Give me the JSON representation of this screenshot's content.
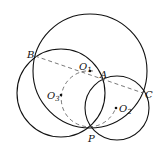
{
  "diagram": {
    "type": "geometry-circles",
    "stroke_color": "#111111",
    "background": "#ffffff",
    "points": [
      {
        "id": "B",
        "label": "B",
        "x": 35,
        "y": 56
      },
      {
        "id": "A",
        "label": "A",
        "x": 103,
        "y": 80
      },
      {
        "id": "C",
        "label": "C",
        "x": 143,
        "y": 93
      },
      {
        "id": "P",
        "label": "P",
        "x": 92,
        "y": 127
      },
      {
        "id": "O1",
        "label": "O",
        "sub": "1",
        "x": 90,
        "y": 71
      },
      {
        "id": "O2",
        "label": "O",
        "sub": "2",
        "x": 117,
        "y": 108
      },
      {
        "id": "O3",
        "label": "O",
        "sub": "3",
        "x": 61,
        "y": 95
      }
    ],
    "circles": [
      {
        "id": "circle-O1",
        "cx": 90,
        "cy": 71,
        "r": 57,
        "style": "solid"
      },
      {
        "id": "circle-left",
        "cx": 61,
        "cy": 93,
        "r": 44,
        "style": "solid"
      },
      {
        "id": "circle-O2",
        "cx": 117,
        "cy": 108,
        "r": 32,
        "style": "solid"
      },
      {
        "id": "circle-O3-dashed",
        "cx": 89,
        "cy": 99,
        "r": 28,
        "style": "dashed"
      }
    ],
    "segments": [
      {
        "id": "BC",
        "from": "B",
        "to": "C",
        "style": "dashed"
      }
    ]
  }
}
